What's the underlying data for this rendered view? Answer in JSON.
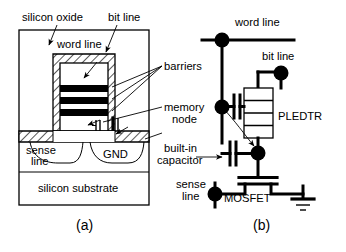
{
  "figure": {
    "panels": [
      {
        "id": "panel-a",
        "caption": "(a)",
        "type": "device-cross-section"
      },
      {
        "id": "panel-b",
        "caption": "(b)",
        "type": "circuit-schematic"
      }
    ]
  },
  "panel_a": {
    "caption": "(a)",
    "labels": {
      "silicon_oxide": "silicon oxide",
      "bit_line": "bit line",
      "word_line": "word line",
      "sense_line_1": "sense",
      "sense_line_2": "line",
      "gnd": "GND",
      "silicon_substrate": "silicon substrate"
    }
  },
  "callouts": {
    "barriers": "barriers",
    "memory_node_1": "memory",
    "memory_node_2": "node",
    "built_in_1": "built-in",
    "built_in_2": "capacitor"
  },
  "panel_b": {
    "caption": "(b)",
    "labels": {
      "word_line": "word line",
      "bit_line": "bit line",
      "pledtr": "PLEDTR",
      "sense_line_1": "sense",
      "sense_line_2": "line",
      "mosfet": "MOSFET"
    },
    "components": {
      "pledtr_segments": 4,
      "capacitor_plates": 2,
      "ground_bars": 3,
      "terminal_nodes": 4
    }
  },
  "colors": {
    "ink": "#000000",
    "paper": "#ffffff",
    "barrier_fill": "#000000",
    "oxide_fill": "#ffffff"
  }
}
